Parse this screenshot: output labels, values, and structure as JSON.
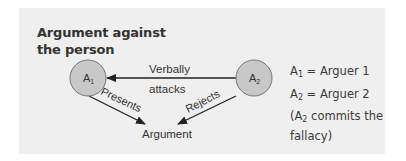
{
  "title_line1": "Argument against",
  "title_line2": "the person",
  "nodes": {
    "a1": {
      "label": "A",
      "sub": "1"
    },
    "a2": {
      "label": "A",
      "sub": "2"
    },
    "argument": "Argument"
  },
  "edges": {
    "attack_line1": "Verbally",
    "attack_line2": "attacks",
    "presents": "Presents",
    "rejects": "Rejects"
  },
  "legend": {
    "a1_sub": "1",
    "a1_text": " = Arguer 1",
    "a2_sub": "2",
    "a2_text": " = Arguer 2",
    "note_open": "(A",
    "note_sub": "2",
    "note_rest": " commits the",
    "note_line2": "fallacy)"
  },
  "colors": {
    "panel": "#efefef",
    "node_fill": "#c8c8c8",
    "line": "#222222"
  }
}
